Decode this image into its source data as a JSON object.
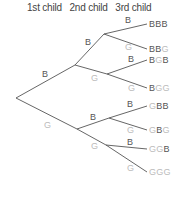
{
  "header": {
    "columns": [
      "1st child",
      "2nd child",
      "3rd child"
    ]
  },
  "colors": {
    "boy": "#555555",
    "girl": "#bbbbbb",
    "line": "#555555"
  },
  "tree": {
    "level1": [
      {
        "label": "B",
        "type": "b"
      },
      {
        "label": "G",
        "type": "g"
      }
    ],
    "level2": [
      {
        "label": "B",
        "type": "b"
      },
      {
        "label": "G",
        "type": "g"
      },
      {
        "label": "B",
        "type": "b"
      },
      {
        "label": "G",
        "type": "g"
      }
    ],
    "level3": [
      {
        "label": "B",
        "type": "b"
      },
      {
        "label": "G",
        "type": "g"
      },
      {
        "label": "B",
        "type": "b"
      },
      {
        "label": "G",
        "type": "g"
      },
      {
        "label": "B",
        "type": "b"
      },
      {
        "label": "G",
        "type": "g"
      },
      {
        "label": "B",
        "type": "b"
      },
      {
        "label": "G",
        "type": "g"
      }
    ],
    "outcomes": [
      "BBB",
      "BBG",
      "BGB",
      "BGG",
      "GBB",
      "GBG",
      "GGB",
      "GGG"
    ]
  }
}
